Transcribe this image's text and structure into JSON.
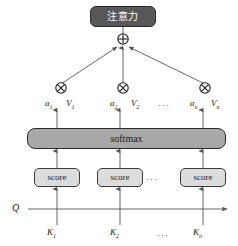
{
  "diagram": {
    "colors": {
      "attention_box_fill": "#58585a",
      "attention_box_text": "#ffffff",
      "softmax_fill": "#a8a8a8",
      "score_fill": "#dcdcdc",
      "stroke": "#2b2b2d",
      "background": "#ffffff",
      "arrow": "#555555"
    },
    "output": {
      "label": "注意力"
    },
    "sum_node": {
      "symbol": "+",
      "name": "circle-plus"
    },
    "softmax": {
      "label": "softmax"
    },
    "score_boxes": [
      {
        "label": "score"
      },
      {
        "label": "score"
      },
      {
        "label": "score"
      }
    ],
    "multiply_nodes": [
      {
        "symbol": "×",
        "name": "circle-times"
      },
      {
        "symbol": "×",
        "name": "circle-times"
      },
      {
        "symbol": "×",
        "name": "circle-times"
      }
    ],
    "weight_value_labels": [
      {
        "weight": "a",
        "weight_sub": "1",
        "value": "V",
        "value_sub": "1"
      },
      {
        "weight": "a",
        "weight_sub": "2",
        "value": "V",
        "value_sub": "2"
      },
      {
        "weight": "a",
        "weight_sub": "n",
        "value": "V",
        "value_sub": "n"
      }
    ],
    "query_label": "Q",
    "key_labels": [
      {
        "base": "K",
        "sub": "1"
      },
      {
        "base": "K",
        "sub": "2"
      },
      {
        "base": "K",
        "sub": "n"
      }
    ],
    "ellipsis": "···"
  }
}
